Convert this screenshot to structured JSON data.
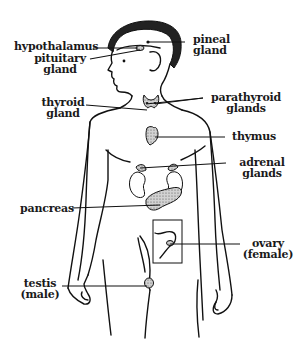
{
  "diagram": {
    "colors": {
      "ink": "#111111",
      "gland_fill": "#b9b9b9",
      "background": "#ffffff"
    },
    "labels": {
      "hypothalamus": "hypothalamus",
      "pituitary": "pituitary\ngland",
      "pineal": "pineal\ngland",
      "thyroid": "thyroid\ngland",
      "parathyroid": "parathyroid\nglands",
      "thymus": "thymus",
      "adrenal": "adrenal\nglands",
      "pancreas": "pancreas",
      "ovary": "ovary\n(female)",
      "testis": "testis\n(male)"
    }
  }
}
